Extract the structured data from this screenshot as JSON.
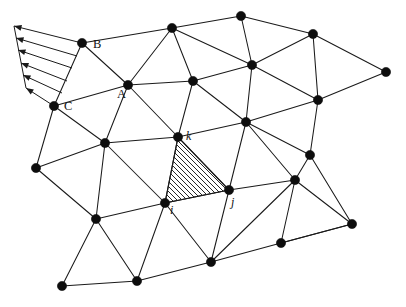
{
  "figure": {
    "background_color": "#ffffff",
    "line_color": "#1a1a1a",
    "node_color": "#0d0d0d",
    "width": 406,
    "height": 307
  },
  "labels": {
    "A": {
      "text": "A",
      "x": 117,
      "y": 88
    },
    "B": {
      "text": "B",
      "x": 93,
      "y": 38
    },
    "C": {
      "text": "C",
      "x": 64,
      "y": 100
    },
    "i": {
      "text": "i",
      "x": 170,
      "y": 204
    },
    "j": {
      "text": "j",
      "x": 231,
      "y": 196
    },
    "k": {
      "text": "k",
      "x": 186,
      "y": 130
    }
  },
  "mesh_data": {
    "type": "diagram",
    "node_count": 24,
    "node_radius": 4.6,
    "nodes": [
      {
        "id": "n0",
        "x": 82,
        "y": 43,
        "label": "B"
      },
      {
        "id": "n1",
        "x": 172,
        "y": 28,
        "label": ""
      },
      {
        "id": "n2",
        "x": 241,
        "y": 16,
        "label": ""
      },
      {
        "id": "n3",
        "x": 313,
        "y": 34,
        "label": ""
      },
      {
        "id": "n4",
        "x": 386,
        "y": 72,
        "label": ""
      },
      {
        "id": "n5",
        "x": 54,
        "y": 106,
        "label": "C"
      },
      {
        "id": "n6",
        "x": 128,
        "y": 85,
        "label": "A"
      },
      {
        "id": "n7",
        "x": 193,
        "y": 81,
        "label": ""
      },
      {
        "id": "n8",
        "x": 252,
        "y": 65,
        "label": ""
      },
      {
        "id": "n9",
        "x": 318,
        "y": 100,
        "label": ""
      },
      {
        "id": "n10",
        "x": 36,
        "y": 168,
        "label": ""
      },
      {
        "id": "n11",
        "x": 105,
        "y": 143,
        "label": ""
      },
      {
        "id": "n12",
        "x": 178,
        "y": 137,
        "label": "k"
      },
      {
        "id": "n13",
        "x": 246,
        "y": 122,
        "label": ""
      },
      {
        "id": "n14",
        "x": 310,
        "y": 155,
        "label": ""
      },
      {
        "id": "n15",
        "x": 96,
        "y": 219,
        "label": ""
      },
      {
        "id": "n16",
        "x": 165,
        "y": 203,
        "label": "i"
      },
      {
        "id": "n17",
        "x": 229,
        "y": 190,
        "label": "j"
      },
      {
        "id": "n18",
        "x": 295,
        "y": 180,
        "label": ""
      },
      {
        "id": "n19",
        "x": 352,
        "y": 224,
        "label": ""
      },
      {
        "id": "n20",
        "x": 62,
        "y": 286,
        "label": ""
      },
      {
        "id": "n21",
        "x": 137,
        "y": 281,
        "label": ""
      },
      {
        "id": "n22",
        "x": 211,
        "y": 262,
        "label": ""
      },
      {
        "id": "n23",
        "x": 281,
        "y": 243,
        "label": ""
      }
    ],
    "edges": [
      [
        "n0",
        "n1"
      ],
      [
        "n1",
        "n2"
      ],
      [
        "n2",
        "n3"
      ],
      [
        "n3",
        "n4"
      ],
      [
        "n0",
        "n5"
      ],
      [
        "n0",
        "n6"
      ],
      [
        "n1",
        "n6"
      ],
      [
        "n1",
        "n7"
      ],
      [
        "n1",
        "n8"
      ],
      [
        "n2",
        "n8"
      ],
      [
        "n3",
        "n8"
      ],
      [
        "n3",
        "n9"
      ],
      [
        "n4",
        "n9"
      ],
      [
        "n5",
        "n6"
      ],
      [
        "n6",
        "n7"
      ],
      [
        "n7",
        "n8"
      ],
      [
        "n8",
        "n9"
      ],
      [
        "n5",
        "n10"
      ],
      [
        "n5",
        "n11"
      ],
      [
        "n6",
        "n11"
      ],
      [
        "n6",
        "n12"
      ],
      [
        "n7",
        "n12"
      ],
      [
        "n7",
        "n13"
      ],
      [
        "n8",
        "n13"
      ],
      [
        "n9",
        "n13"
      ],
      [
        "n9",
        "n14"
      ],
      [
        "n10",
        "n11"
      ],
      [
        "n11",
        "n12"
      ],
      [
        "n12",
        "n13"
      ],
      [
        "n13",
        "n14"
      ],
      [
        "n10",
        "n15"
      ],
      [
        "n11",
        "n15"
      ],
      [
        "n11",
        "n16"
      ],
      [
        "n12",
        "n16"
      ],
      [
        "n13",
        "n17"
      ],
      [
        "n13",
        "n18"
      ],
      [
        "n14",
        "n18"
      ],
      [
        "n14",
        "n19"
      ],
      [
        "n15",
        "n16"
      ],
      [
        "n16",
        "n17"
      ],
      [
        "n17",
        "n18"
      ],
      [
        "n18",
        "n19"
      ],
      [
        "n15",
        "n20"
      ],
      [
        "n15",
        "n21"
      ],
      [
        "n16",
        "n21"
      ],
      [
        "n16",
        "n22"
      ],
      [
        "n17",
        "n22"
      ],
      [
        "n18",
        "n22"
      ],
      [
        "n18",
        "n23"
      ],
      [
        "n19",
        "n23"
      ],
      [
        "n20",
        "n21"
      ],
      [
        "n21",
        "n22"
      ],
      [
        "n22",
        "n23"
      ],
      [
        "n23",
        "n19"
      ],
      [
        "n12",
        "n17"
      ]
    ],
    "highlighted_element": {
      "name": "element-ijk",
      "vertices": [
        "n16",
        "n17",
        "n12"
      ],
      "vertex_labels": [
        "i",
        "j",
        "k"
      ],
      "fill_pattern": "diagonal-hatch",
      "hatch_angle_deg": 45,
      "hatch_spacing": 5
    },
    "load": {
      "name": "distributed-edge-load",
      "applied_edge": [
        "n0",
        "n5"
      ],
      "arrow_count": 6,
      "direction": "leftward-outward",
      "tail_line": [
        [
          82,
          43
        ],
        [
          54,
          106
        ]
      ],
      "head_line": [
        [
          14,
          26
        ],
        [
          26,
          88
        ]
      ],
      "arrows": [
        {
          "tail_x": 82,
          "tail_y": 43,
          "head_x": 14,
          "head_y": 26
        },
        {
          "tail_x": 77,
          "tail_y": 56,
          "head_x": 16,
          "head_y": 38
        },
        {
          "tail_x": 72,
          "tail_y": 68,
          "head_x": 18,
          "head_y": 50
        },
        {
          "tail_x": 67,
          "tail_y": 81,
          "head_x": 21,
          "head_y": 63
        },
        {
          "tail_x": 62,
          "tail_y": 93,
          "head_x": 23,
          "head_y": 75
        },
        {
          "tail_x": 54,
          "tail_y": 106,
          "head_x": 26,
          "head_y": 88
        }
      ]
    }
  }
}
